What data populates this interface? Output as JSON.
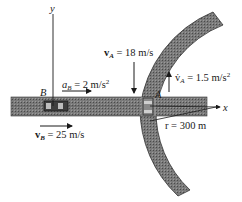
{
  "figure": {
    "axes": {
      "y_label": "y",
      "x_label": "x"
    },
    "car_b": {
      "label": "B",
      "accel": {
        "symbol": "a",
        "sub": "B",
        "text": " = 2 m/s",
        "sup": "2"
      },
      "velocity": {
        "symbol": "v",
        "sub": "B",
        "text": " = 25 m/s"
      }
    },
    "car_a": {
      "label": "A",
      "velocity": {
        "symbol": "v",
        "sub": "A",
        "text": " = 18 m/s"
      },
      "tangential_accel": {
        "symbol": "v̇",
        "sub": "A",
        "text": " = 1.5 m/s",
        "sup": "2"
      }
    },
    "curve": {
      "radius_text": "r = 300 m"
    },
    "colors": {
      "road": "#6e6e6e",
      "road_dark": "#4a4a4a",
      "ink": "#1a1a1a",
      "background": "#ffffff"
    }
  }
}
